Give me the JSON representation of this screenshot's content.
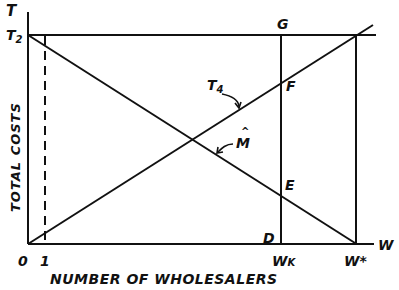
{
  "diagram": {
    "axis_labels": {
      "y_axis_top": "T",
      "x_axis_right": "W",
      "y_title": "TOTAL COSTS",
      "x_title": "NUMBER OF WHOLESALERS"
    },
    "tick_labels": {
      "origin": "0",
      "one": "1",
      "t2": "T",
      "t2_sub": "2",
      "wk": "W",
      "wk_sub": "K",
      "wstar": "W*"
    },
    "point_labels": {
      "G": "G",
      "F": "F",
      "E": "E",
      "D": "D"
    },
    "curve_labels": {
      "t4": "T",
      "t4_sub": "4",
      "m_hat": "M",
      "m_hat_accent": "^"
    },
    "colors": {
      "line": "#111111",
      "background": "#ffffff"
    }
  }
}
